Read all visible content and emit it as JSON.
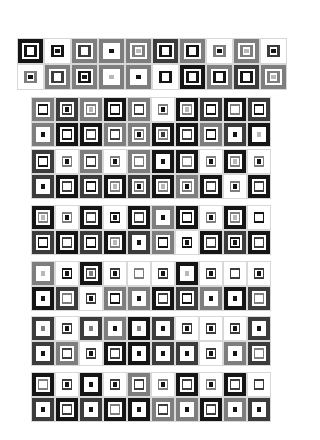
{
  "palette": {
    "K": "#151515",
    "D": "#3c3c3c",
    "G": "#7e7e7e",
    "L": "#b8b8b8",
    "W": "#ffffff"
  },
  "blocks": [
    {
      "x": 17,
      "y": 38,
      "tile_w": 27,
      "tile_h": 26,
      "rows": [
        [
          "KKW",
          "WKK",
          "GDW",
          "GWK",
          "GGL",
          "DKW",
          "GKW",
          "WGK",
          "GGL",
          "WDK"
        ],
        [
          "WGK",
          "GDW",
          "GKK",
          "GWL",
          "GWK",
          "WKW",
          "KKW",
          "GKW",
          "DKW",
          "GGL"
        ]
      ]
    },
    {
      "x": 31,
      "y": 97,
      "tile_w": 24,
      "tile_h": 25,
      "rows": [
        [
          "GKW",
          "DDK",
          "GGL",
          "KKW",
          "GDW",
          "WGK",
          "KGL",
          "DKW",
          "KGW",
          "DKW"
        ],
        [
          "GWK",
          "KKW",
          "KDW",
          "GDW",
          "GGK",
          "KGD",
          "KDW",
          "GKW",
          "DWK",
          "KWL"
        ]
      ]
    },
    {
      "x": 31,
      "y": 149,
      "tile_w": 24,
      "tile_h": 25,
      "rows": [
        [
          "DKW",
          "WGK",
          "GDW",
          "WGK",
          "GGW",
          "KWK",
          "KGW",
          "WGK",
          "KGL",
          "WGK"
        ],
        [
          "DWK",
          "KDW",
          "DKW",
          "KGL",
          "DGK",
          "KGL",
          "GGK",
          "KDW",
          "WGK",
          "KDW"
        ]
      ]
    },
    {
      "x": 31,
      "y": 205,
      "tile_w": 24,
      "tile_h": 25,
      "rows": [
        [
          "KGL",
          "WGK",
          "KDW",
          "WKK",
          "KDW",
          "GWK",
          "KKW",
          "WGK",
          "KGL",
          "WKW"
        ],
        [
          "DKW",
          "KDW",
          "DKW",
          "KGL",
          "DWK",
          "GKW",
          "WKK",
          "KDW",
          "DKK",
          "KDW"
        ]
      ]
    },
    {
      "x": 31,
      "y": 261,
      "tile_w": 24,
      "tile_h": 25,
      "rows": [
        [
          "GWL",
          "WKK",
          "KDG",
          "WDK",
          "WGW",
          "WDK",
          "KWL",
          "WDK",
          "WDW",
          "WDK"
        ],
        [
          "KWK",
          "DGW",
          "WDK",
          "GKW",
          "GWK",
          "KDW",
          "DKW",
          "GWK",
          "KWK",
          "DGW"
        ]
      ]
    },
    {
      "x": 31,
      "y": 316,
      "tile_w": 24,
      "tile_h": 25,
      "rows": [
        [
          "DWG",
          "WDK",
          "DWG",
          "GWK",
          "KWG",
          "DWK",
          "WDK",
          "WDK",
          "WDK",
          "DWK"
        ],
        [
          "DWK",
          "GDW",
          "WDK",
          "KDW",
          "KWK",
          "DWK",
          "DWK",
          "WDK",
          "GWK",
          "DGW"
        ]
      ]
    },
    {
      "x": 31,
      "y": 372,
      "tile_w": 24,
      "tile_h": 25,
      "rows": [
        [
          "KGW",
          "WDK",
          "KWK",
          "WDK",
          "GDW",
          "WGK",
          "KDW",
          "WGK",
          "KDW",
          "WDW"
        ],
        [
          "DWK",
          "KDW",
          "DWK",
          "KGW",
          "KWK",
          "GDW",
          "GWK",
          "KDW",
          "GWK",
          "DWK"
        ]
      ]
    }
  ]
}
